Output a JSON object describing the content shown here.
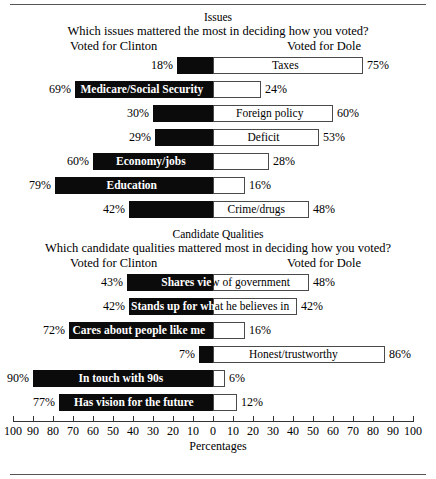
{
  "figure": {
    "axis_caption": "Percentages",
    "left_heading": "Voted for Clinton",
    "right_heading": "Voted for Dole",
    "tick_labels": [
      "100",
      "90",
      "80",
      "70",
      "60",
      "50",
      "40",
      "30",
      "20",
      "10",
      "0",
      "10",
      "20",
      "30",
      "40",
      "50",
      "60",
      "70",
      "80",
      "90",
      "100"
    ]
  },
  "sections": [
    {
      "title": "Issues",
      "question": "Which issues mattered the most in deciding how you voted?"
    },
    {
      "title": "Candidate Qualities",
      "question": "Which candidate qualities mattered most in deciding how you voted?"
    }
  ],
  "chart_data": {
    "type": "bar",
    "orientation": "horizontal",
    "layout": "diverging",
    "xlabel": "Percentages",
    "ylabel": "",
    "xlim": [
      -100,
      100
    ],
    "grid": false,
    "legend": [
      "Voted for Clinton",
      "Voted for Dole"
    ],
    "axis_ticks": [
      100,
      90,
      80,
      70,
      60,
      50,
      40,
      30,
      20,
      10,
      0,
      10,
      20,
      30,
      40,
      50,
      60,
      70,
      80,
      90,
      100
    ],
    "panels": [
      {
        "name": "Issues",
        "categories": [
          "Taxes",
          "Medicare/Social Security",
          "Foreign policy",
          "Deficit",
          "Economy/jobs",
          "Education",
          "Crime/drugs"
        ],
        "series": [
          {
            "name": "Voted for Clinton",
            "values": [
              18,
              69,
              30,
              29,
              60,
              79,
              42
            ]
          },
          {
            "name": "Voted for Dole",
            "values": [
              75,
              24,
              60,
              53,
              28,
              16,
              48
            ]
          }
        ]
      },
      {
        "name": "Candidate Qualities",
        "categories": [
          "Shares view of government",
          "Stands up for what he believes in",
          "Cares about people like me",
          "Honest/trustworthy",
          "In touch with 90s",
          "Has vision for the future"
        ],
        "series": [
          {
            "name": "Voted for Clinton",
            "values": [
              43,
              42,
              72,
              7,
              90,
              77
            ]
          },
          {
            "name": "Voted for Dole",
            "values": [
              48,
              42,
              16,
              86,
              6,
              12
            ]
          }
        ]
      }
    ]
  },
  "rows": {
    "issues": [
      {
        "label": "Taxes",
        "left": "18%",
        "right": "75%",
        "left_val": 18,
        "right_val": 75
      },
      {
        "label": "Medicare/Social Security",
        "left": "69%",
        "right": "24%",
        "left_val": 69,
        "right_val": 24
      },
      {
        "label": "Foreign policy",
        "left": "30%",
        "right": "60%",
        "left_val": 30,
        "right_val": 60
      },
      {
        "label": "Deficit",
        "left": "29%",
        "right": "53%",
        "left_val": 29,
        "right_val": 53
      },
      {
        "label": "Economy/jobs",
        "left": "60%",
        "right": "28%",
        "left_val": 60,
        "right_val": 28
      },
      {
        "label": "Education",
        "left": "79%",
        "right": "16%",
        "left_val": 79,
        "right_val": 16
      },
      {
        "label": "Crime/drugs",
        "left": "42%",
        "right": "48%",
        "left_val": 42,
        "right_val": 48
      }
    ],
    "qualities": [
      {
        "label": "Shares view of government",
        "left": "43%",
        "right": "48%",
        "left_val": 43,
        "right_val": 48
      },
      {
        "label": "Stands up for what he believes in",
        "left": "42%",
        "right": "42%",
        "left_val": 42,
        "right_val": 42
      },
      {
        "label": "Cares about people like me",
        "left": "72%",
        "right": "16%",
        "left_val": 72,
        "right_val": 16
      },
      {
        "label": "Honest/trustworthy",
        "left": "7%",
        "right": "86%",
        "left_val": 7,
        "right_val": 86
      },
      {
        "label": "In touch with 90s",
        "left": "90%",
        "right": "6%",
        "left_val": 90,
        "right_val": 6
      },
      {
        "label": "Has vision for the future",
        "left": "77%",
        "right": "12%",
        "left_val": 77,
        "right_val": 12
      }
    ]
  }
}
